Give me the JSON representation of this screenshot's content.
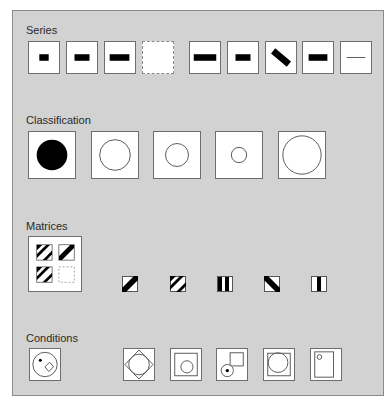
{
  "sections": {
    "series": {
      "title": "Series",
      "items": [
        {
          "icon": "small-bar-icon"
        },
        {
          "icon": "medium-bar-icon"
        },
        {
          "icon": "wide-bar-icon"
        },
        {
          "icon": "empty-dashed-icon"
        },
        {
          "icon": "wide-bar-icon"
        },
        {
          "icon": "medium-bar-icon"
        },
        {
          "icon": "rotated-bar-icon"
        },
        {
          "icon": "medium-bar-icon"
        },
        {
          "icon": "thin-line-icon"
        }
      ]
    },
    "classification": {
      "title": "Classification",
      "items": [
        {
          "icon": "filled-circle-icon"
        },
        {
          "icon": "large-circle-outline-icon"
        },
        {
          "icon": "medium-circle-outline-icon"
        },
        {
          "icon": "small-circle-outline-icon"
        },
        {
          "icon": "xlarge-circle-outline-icon"
        }
      ]
    },
    "matrices": {
      "title": "Matrices",
      "grid": [
        {
          "icon": "double-stripe-icon"
        },
        {
          "icon": "single-stripe-icon"
        },
        {
          "icon": "double-stripe-icon"
        },
        {
          "icon": "empty-dashed-icon"
        }
      ],
      "options": [
        {
          "icon": "single-diagonal-stripe-icon"
        },
        {
          "icon": "double-diagonal-stripe-icon"
        },
        {
          "icon": "double-vertical-stripe-icon"
        },
        {
          "icon": "reverse-diagonal-stripe-icon"
        },
        {
          "icon": "single-vertical-stripe-icon"
        }
      ]
    },
    "conditions": {
      "title": "Conditions",
      "items": [
        {
          "icon": "circle-with-dot-and-diamond-icon"
        },
        {
          "icon": "circle-in-diamond-icon"
        },
        {
          "icon": "circle-in-square-icon"
        },
        {
          "icon": "dotted-circle-and-square-icon"
        },
        {
          "icon": "large-circle-in-square-icon"
        },
        {
          "icon": "small-circle-in-rectangle-icon"
        }
      ]
    }
  },
  "colors": {
    "panel_bg": "#d2d2d2",
    "box_bg": "#ffffff",
    "border": "#6e6e6e",
    "fill": "#000000"
  }
}
